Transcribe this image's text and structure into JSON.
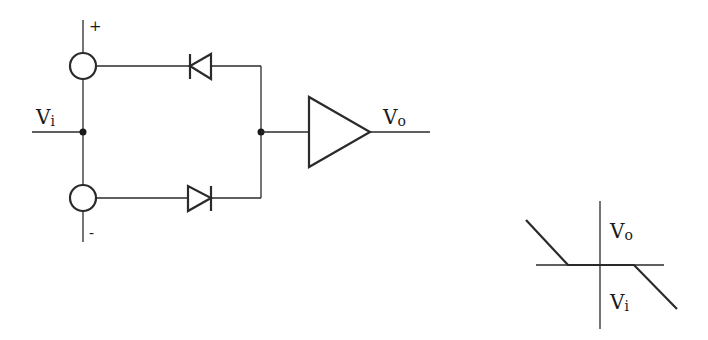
{
  "circuit": {
    "input_label": "V",
    "input_sub": "i",
    "output_label": "V",
    "output_sub": "o",
    "plus_sign": "+",
    "minus_sign": "-"
  },
  "transfer_plot": {
    "y_axis_label": "V",
    "y_axis_sub": "o",
    "x_axis_label": "V",
    "x_axis_sub": "i"
  }
}
